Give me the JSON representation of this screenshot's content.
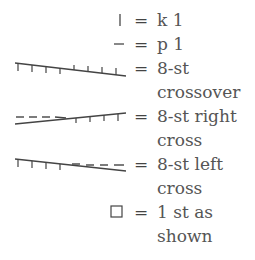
{
  "legend": {
    "items": [
      {
        "symbol": "knit-bar",
        "equals": "=",
        "lines": [
          "k 1"
        ]
      },
      {
        "symbol": "purl-dash",
        "equals": "=",
        "lines": [
          "p 1"
        ]
      },
      {
        "symbol": "8-st-crossover",
        "equals": "=",
        "lines": [
          "8-st",
          "crossover"
        ]
      },
      {
        "symbol": "8-st-right-cross",
        "equals": "=",
        "lines": [
          "8-st right",
          "cross"
        ]
      },
      {
        "symbol": "8-st-left-cross",
        "equals": "=",
        "lines": [
          "8-st left",
          "cross"
        ]
      },
      {
        "symbol": "empty-square",
        "equals": "=",
        "lines": [
          "1 st as",
          "shown"
        ]
      }
    ]
  }
}
